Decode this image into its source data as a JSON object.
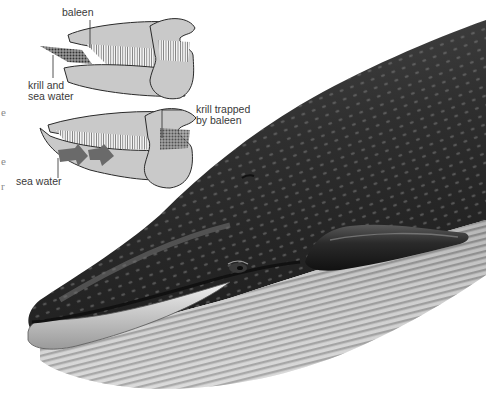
{
  "figure": {
    "colors": {
      "background": "#ffffff",
      "jaw_fill": "#c9c9c9",
      "jaw_outline": "#2a2a2a",
      "krill": "#555555",
      "water_arrow": "#6a6a6a",
      "whale_dark": "#2e2e2e",
      "whale_mid": "#5a5a5a",
      "throat_light": "#d8d8d8",
      "label_text": "#3a3a3a"
    }
  },
  "diagram_top": {
    "labels": {
      "baleen": "baleen",
      "krill_line1": "krill and",
      "krill_line2": "sea water"
    }
  },
  "diagram_bottom": {
    "labels": {
      "trapped_line1": "krill trapped",
      "trapped_line2": "by baleen",
      "sea_water": "sea water"
    }
  },
  "edge_fragments": [
    "e",
    "e",
    "r"
  ]
}
